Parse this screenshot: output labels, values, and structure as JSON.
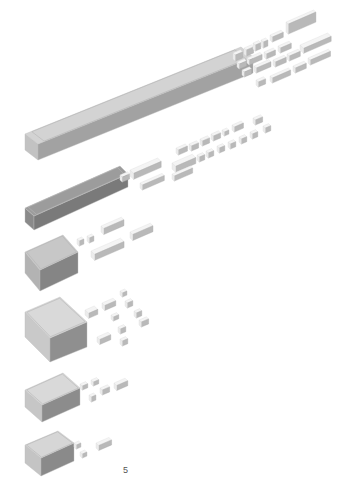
{
  "page": {
    "number": "5",
    "background": "#ffffff"
  },
  "colors": {
    "top_light": "#dcdcdc",
    "top_mid": "#cfcfcf",
    "side_dark": "#8e8e8e",
    "side_mid": "#a9a9a9",
    "block_white": "#f4f4f4",
    "block_shade": "#b9b9b9",
    "edge": "#bdbdbd"
  },
  "diagram": {
    "rows": [
      {
        "id": "row-1",
        "label": "",
        "container": {
          "top": [
            [
              25,
              134
            ],
            [
              241,
              47
            ],
            [
              253,
              57
            ],
            [
              38,
              144
            ]
          ],
          "front": [
            [
              38,
              144
            ],
            [
              253,
              57
            ],
            [
              253,
              73
            ],
            [
              38,
              160
            ]
          ],
          "left": [
            [
              25,
              134
            ],
            [
              38,
              144
            ],
            [
              38,
              160
            ],
            [
              25,
              150
            ]
          ],
          "fill_top": "#d3d3d3",
          "fill_front": "#a2a2a2",
          "fill_left": "#c2c2c2"
        },
        "blocks": [
          {
            "x": 233,
            "y": 53,
            "w": 8,
            "h": 6,
            "d": 5
          },
          {
            "x": 244,
            "y": 48,
            "w": 8,
            "h": 6,
            "d": 5
          },
          {
            "x": 253,
            "y": 43,
            "w": 6,
            "h": 6,
            "d": 5
          },
          {
            "x": 261,
            "y": 40,
            "w": 5,
            "h": 6,
            "d": 5
          },
          {
            "x": 270,
            "y": 35,
            "w": 12,
            "h": 5,
            "d": 5
          },
          {
            "x": 286,
            "y": 22,
            "w": 30,
            "h": 10,
            "d": 5
          },
          {
            "x": 237,
            "y": 62,
            "w": 8,
            "h": 5,
            "d": 5
          },
          {
            "x": 247,
            "y": 58,
            "w": 14,
            "h": 5,
            "d": 5
          },
          {
            "x": 264,
            "y": 52,
            "w": 10,
            "h": 5,
            "d": 5
          },
          {
            "x": 278,
            "y": 46,
            "w": 12,
            "h": 5,
            "d": 5
          },
          {
            "x": 242,
            "y": 70,
            "w": 8,
            "h": 5,
            "d": 5
          },
          {
            "x": 254,
            "y": 66,
            "w": 16,
            "h": 5,
            "d": 5
          },
          {
            "x": 273,
            "y": 60,
            "w": 12,
            "h": 5,
            "d": 5
          },
          {
            "x": 287,
            "y": 54,
            "w": 12,
            "h": 5,
            "d": 5
          },
          {
            "x": 300,
            "y": 45,
            "w": 30,
            "h": 5,
            "d": 8
          },
          {
            "x": 256,
            "y": 80,
            "w": 8,
            "h": 5,
            "d": 5
          },
          {
            "x": 270,
            "y": 76,
            "w": 20,
            "h": 5,
            "d": 5
          },
          {
            "x": 293,
            "y": 66,
            "w": 12,
            "h": 5,
            "d": 5
          },
          {
            "x": 308,
            "y": 58,
            "w": 22,
            "h": 5,
            "d": 5
          }
        ]
      },
      {
        "id": "row-2",
        "label": "",
        "container": {
          "top": [
            [
              25,
              208
            ],
            [
              120,
              166
            ],
            [
              128,
              174
            ],
            [
              34,
              216
            ]
          ],
          "front": [
            [
              34,
              216
            ],
            [
              128,
              174
            ],
            [
              128,
              187
            ],
            [
              34,
              230
            ]
          ],
          "left": [
            [
              25,
              208
            ],
            [
              34,
              216
            ],
            [
              34,
              230
            ],
            [
              25,
              222
            ]
          ],
          "fill_top": "#9c9c9c",
          "fill_front": "#7a7a7a",
          "fill_left": "#8a8a8a"
        },
        "blocks": [
          {
            "x": 120,
            "y": 175,
            "w": 8,
            "h": 5,
            "d": 5
          },
          {
            "x": 130,
            "y": 170,
            "w": 30,
            "h": 6,
            "d": 8
          },
          {
            "x": 140,
            "y": 183,
            "w": 24,
            "h": 5,
            "d": 5
          },
          {
            "x": 172,
            "y": 163,
            "w": 22,
            "h": 6,
            "d": 8
          },
          {
            "x": 172,
            "y": 174,
            "w": 20,
            "h": 5,
            "d": 5
          },
          {
            "x": 176,
            "y": 148,
            "w": 10,
            "h": 5,
            "d": 5
          },
          {
            "x": 189,
            "y": 144,
            "w": 8,
            "h": 5,
            "d": 5
          },
          {
            "x": 200,
            "y": 139,
            "w": 8,
            "h": 5,
            "d": 5
          },
          {
            "x": 211,
            "y": 134,
            "w": 8,
            "h": 5,
            "d": 5
          },
          {
            "x": 222,
            "y": 130,
            "w": 5,
            "h": 4,
            "d": 5
          },
          {
            "x": 232,
            "y": 125,
            "w": 10,
            "h": 5,
            "d": 5
          },
          {
            "x": 253,
            "y": 118,
            "w": 8,
            "h": 5,
            "d": 5
          },
          {
            "x": 197,
            "y": 155,
            "w": 6,
            "h": 5,
            "d": 5
          },
          {
            "x": 206,
            "y": 151,
            "w": 6,
            "h": 5,
            "d": 5
          },
          {
            "x": 217,
            "y": 146,
            "w": 6,
            "h": 5,
            "d": 5
          },
          {
            "x": 228,
            "y": 142,
            "w": 6,
            "h": 5,
            "d": 5
          },
          {
            "x": 239,
            "y": 137,
            "w": 6,
            "h": 5,
            "d": 5
          },
          {
            "x": 250,
            "y": 132,
            "w": 6,
            "h": 5,
            "d": 5
          },
          {
            "x": 263,
            "y": 126,
            "w": 6,
            "h": 5,
            "d": 5
          }
        ]
      },
      {
        "id": "row-3",
        "label": "",
        "container": {
          "top": [
            [
              25,
              252
            ],
            [
              63,
              235
            ],
            [
              78,
              252
            ],
            [
              40,
              270
            ]
          ],
          "front": [
            [
              40,
              270
            ],
            [
              78,
              252
            ],
            [
              78,
              273
            ],
            [
              40,
              291
            ]
          ],
          "left": [
            [
              25,
              252
            ],
            [
              40,
              270
            ],
            [
              40,
              291
            ],
            [
              25,
              273
            ]
          ],
          "fill_top": "#c7c7c7",
          "fill_front": "#858585",
          "fill_left": "#b3b3b3"
        },
        "blocks": [
          {
            "x": 77,
            "y": 239,
            "w": 5,
            "h": 5,
            "d": 5
          },
          {
            "x": 87,
            "y": 236,
            "w": 5,
            "h": 5,
            "d": 5
          },
          {
            "x": 101,
            "y": 226,
            "w": 22,
            "h": 6,
            "d": 6
          },
          {
            "x": 91,
            "y": 251,
            "w": 32,
            "h": 6,
            "d": 8
          },
          {
            "x": 130,
            "y": 232,
            "w": 22,
            "h": 6,
            "d": 6
          }
        ]
      },
      {
        "id": "row-4",
        "label": "",
        "container": {
          "top": [
            [
              25,
              312
            ],
            [
              60,
              297
            ],
            [
              87,
              322
            ],
            [
              50,
              338
            ]
          ],
          "front": [
            [
              50,
              338
            ],
            [
              87,
              322
            ],
            [
              87,
              347
            ],
            [
              50,
              362
            ]
          ],
          "left": [
            [
              25,
              312
            ],
            [
              50,
              338
            ],
            [
              50,
              362
            ],
            [
              25,
              337
            ]
          ],
          "fill_top": "#d9d9d9",
          "fill_front": "#8f8f8f",
          "fill_left": "#c9c9c9"
        },
        "blocks": [
          {
            "x": 85,
            "y": 310,
            "w": 10,
            "h": 5,
            "d": 8
          },
          {
            "x": 102,
            "y": 303,
            "w": 12,
            "h": 5,
            "d": 6
          },
          {
            "x": 120,
            "y": 291,
            "w": 5,
            "h": 4,
            "d": 5
          },
          {
            "x": 125,
            "y": 301,
            "w": 6,
            "h": 5,
            "d": 5
          },
          {
            "x": 111,
            "y": 315,
            "w": 6,
            "h": 4,
            "d": 5
          },
          {
            "x": 134,
            "y": 311,
            "w": 6,
            "h": 5,
            "d": 5
          },
          {
            "x": 139,
            "y": 320,
            "w": 8,
            "h": 5,
            "d": 5
          },
          {
            "x": 97,
            "y": 337,
            "w": 12,
            "h": 5,
            "d": 6
          },
          {
            "x": 118,
            "y": 327,
            "w": 6,
            "h": 5,
            "d": 5
          },
          {
            "x": 120,
            "y": 339,
            "w": 6,
            "h": 5,
            "d": 5
          }
        ]
      },
      {
        "id": "row-5",
        "label": "",
        "container": {
          "top": [
            [
              25,
              390
            ],
            [
              63,
              373
            ],
            [
              80,
              388
            ],
            [
              42,
              405
            ]
          ],
          "front": [
            [
              42,
              405
            ],
            [
              80,
              388
            ],
            [
              80,
              405
            ],
            [
              42,
              422
            ]
          ],
          "left": [
            [
              25,
              390
            ],
            [
              42,
              405
            ],
            [
              42,
              422
            ],
            [
              25,
              407
            ]
          ],
          "fill_top": "#d9d9d9",
          "fill_front": "#8c8c8c",
          "fill_left": "#c6c6c6"
        },
        "blocks": [
          {
            "x": 80,
            "y": 384,
            "w": 6,
            "h": 4,
            "d": 5
          },
          {
            "x": 91,
            "y": 380,
            "w": 6,
            "h": 4,
            "d": 5
          },
          {
            "x": 89,
            "y": 395,
            "w": 5,
            "h": 5,
            "d": 5
          },
          {
            "x": 100,
            "y": 388,
            "w": 8,
            "h": 5,
            "d": 5
          },
          {
            "x": 114,
            "y": 383,
            "w": 12,
            "h": 5,
            "d": 6
          }
        ]
      },
      {
        "id": "row-6",
        "label": "",
        "container": {
          "top": [
            [
              25,
              445
            ],
            [
              58,
              431
            ],
            [
              74,
              443
            ],
            [
              41,
              458
            ]
          ],
          "front": [
            [
              41,
              458
            ],
            [
              74,
              443
            ],
            [
              74,
              461
            ],
            [
              41,
              476
            ]
          ],
          "left": [
            [
              25,
              445
            ],
            [
              41,
              458
            ],
            [
              41,
              476
            ],
            [
              25,
              463
            ]
          ],
          "fill_top": "#d6d6d6",
          "fill_front": "#8a8a8a",
          "fill_left": "#c4c4c4"
        },
        "blocks": [
          {
            "x": 74,
            "y": 443,
            "w": 5,
            "h": 4,
            "d": 5
          },
          {
            "x": 80,
            "y": 452,
            "w": 5,
            "h": 4,
            "d": 5
          },
          {
            "x": 96,
            "y": 443,
            "w": 14,
            "h": 5,
            "d": 6
          }
        ]
      }
    ]
  }
}
